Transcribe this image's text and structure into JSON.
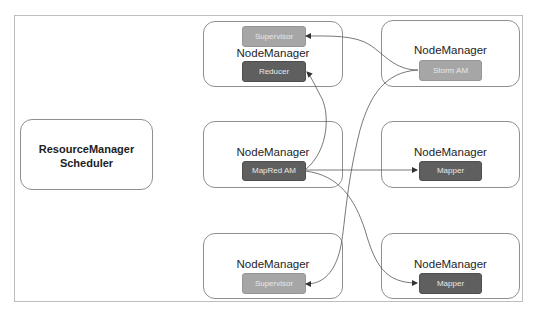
{
  "resource_manager": {
    "line1": "ResourceManager",
    "line2": "Scheduler"
  },
  "nodes": {
    "top_middle": {
      "label": "NodeManager",
      "components": [
        "Supervisor",
        "Reducer"
      ]
    },
    "top_right": {
      "label": "NodeManager",
      "components": [
        "Storm AM"
      ]
    },
    "middle_center": {
      "label": "NodeManager",
      "components": [
        "MapRed AM"
      ]
    },
    "middle_right": {
      "label": "NodeManager",
      "components": [
        "Mapper"
      ]
    },
    "bottom_center": {
      "label": "NodeManager",
      "components": [
        "Supervisor"
      ]
    },
    "bottom_right": {
      "label": "NodeManager",
      "components": [
        "Mapper"
      ]
    }
  },
  "edges": [
    {
      "from": "Storm AM",
      "to": "Supervisor (top)"
    },
    {
      "from": "Storm AM",
      "to": "Supervisor (bottom)"
    },
    {
      "from": "MapRed AM",
      "to": "Reducer"
    },
    {
      "from": "MapRed AM",
      "to": "Mapper (middle)"
    },
    {
      "from": "MapRed AM",
      "to": "Mapper (bottom)"
    }
  ],
  "colors": {
    "component_dark": "#5f5f5f",
    "component_light": "#a6a6a6",
    "box_border": "#8f8f8f",
    "arrow": "#555555"
  }
}
